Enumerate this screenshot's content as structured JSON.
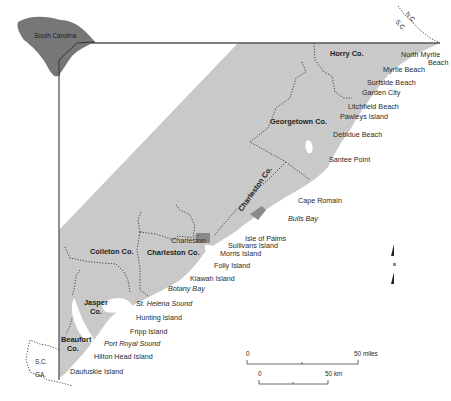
{
  "inset_map": {
    "label": "South Carolina",
    "fill": "#777777"
  },
  "colors": {
    "land": "#c9c9c9",
    "water": "#ffffff",
    "frame": "#555555"
  },
  "state_border_labels": {
    "nc": "N.C.",
    "sc_north": "S.C.",
    "sc_south": "S.C.",
    "ga": "GA."
  },
  "counties": [
    {
      "name": "Horry Co."
    },
    {
      "name": "Georgetown Co."
    },
    {
      "name": "Charleston Co.",
      "note": "rotated label along coast"
    },
    {
      "name": "Charleston Co."
    },
    {
      "name": "Colleton Co."
    },
    {
      "name": "Jasper Co.",
      "lines": [
        "Jasper",
        "Co."
      ]
    },
    {
      "name": "Beaufort Co.",
      "lines": [
        "Beaufort",
        "Co."
      ]
    }
  ],
  "places": [
    {
      "name": "North Myrtle Beach",
      "lines": [
        "North Myrtle",
        "Beach"
      ]
    },
    {
      "name": "Myrtle Beach"
    },
    {
      "name": "Surfside Beach"
    },
    {
      "name": "Garden City"
    },
    {
      "name": "Litchfield Beach"
    },
    {
      "name": "Pawleys Island"
    },
    {
      "name": "Debidue Beach"
    },
    {
      "name": "Santee Point"
    },
    {
      "name": "Cape Romain"
    },
    {
      "name": "Charleston"
    },
    {
      "name": "Isle of Palms"
    },
    {
      "name": "Sullivans Island"
    },
    {
      "name": "Morris Island"
    },
    {
      "name": "Folly Island"
    },
    {
      "name": "Kiawah Island"
    },
    {
      "name": "Hunting Island"
    },
    {
      "name": "Fripp Island"
    },
    {
      "name": "Hilton Head Island"
    },
    {
      "name": "Daufuskie Island"
    }
  ],
  "water_bodies": [
    {
      "name": "Bulls Bay"
    },
    {
      "name": "Botany Bay"
    },
    {
      "name": "St. Helena Sound"
    },
    {
      "name": "Port Royal Sound"
    }
  ],
  "scale_bars": {
    "miles": {
      "start": "0",
      "end": "50 miles"
    },
    "km": {
      "start": "0",
      "end": "50 km"
    }
  },
  "north_arrow": {
    "label": "N"
  }
}
